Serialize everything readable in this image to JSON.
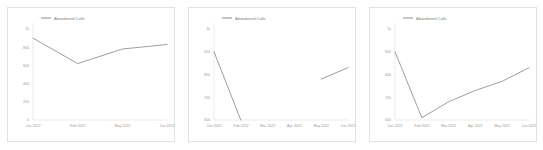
{
  "accent_color": "#8c8c8c",
  "axis_color": "#d4d4d4",
  "label_color": "#9a9a9a",
  "panel_border_color": "#e2e2e2",
  "background_color": "#ffffff",
  "legend": {
    "label": "Abandoned Calls",
    "position": "top-left",
    "swatch_icon": "line-swatch-icon"
  },
  "chart_data": [
    {
      "type": "line",
      "title": "",
      "subtitle": "",
      "xlabel": "",
      "ylabel": "",
      "grid": false,
      "legend_position": "top-left",
      "ylim": [
        0,
        1000
      ],
      "yticks": [
        0,
        200,
        400,
        600,
        800,
        1000
      ],
      "ytick_labels": [
        "0",
        "200",
        "400",
        "600",
        "800",
        "1k"
      ],
      "categories": [
        "Jan 2022",
        "Feb 2022",
        "May 2022",
        "Jun 2022"
      ],
      "series": [
        {
          "name": "Abandoned Calls",
          "values": [
            900,
            620,
            780,
            830
          ]
        }
      ]
    },
    {
      "type": "line",
      "title": "",
      "subtitle": "",
      "xlabel": "",
      "ylabel": "",
      "grid": false,
      "legend_position": "top-left",
      "ylim": [
        600,
        1000
      ],
      "yticks": [
        600,
        700,
        800,
        900,
        1000
      ],
      "ytick_labels": [
        "600",
        "700",
        "800",
        "900",
        "1k"
      ],
      "categories": [
        "Jan 2022",
        "Feb 2022",
        "Mar 2022",
        "Apr 2022",
        "May 2022",
        "Jun 2022"
      ],
      "series": [
        {
          "name": "Abandoned Calls",
          "values": [
            900,
            600,
            null,
            null,
            780,
            830
          ]
        }
      ]
    },
    {
      "type": "line",
      "title": "",
      "subtitle": "",
      "xlabel": "",
      "ylabel": "",
      "grid": false,
      "legend_position": "top-left",
      "ylim": [
        600,
        1000
      ],
      "yticks": [
        600,
        700,
        800,
        900,
        1000
      ],
      "ytick_labels": [
        "600",
        "700",
        "800",
        "900",
        "1k"
      ],
      "categories": [
        "Jan 2022",
        "Feb 2022",
        "Mar 2022",
        "Apr 2022",
        "May 2022",
        "Jun 2022"
      ],
      "series": [
        {
          "name": "Abandoned Calls",
          "values": [
            900,
            610,
            680,
            730,
            770,
            830
          ]
        }
      ]
    }
  ]
}
